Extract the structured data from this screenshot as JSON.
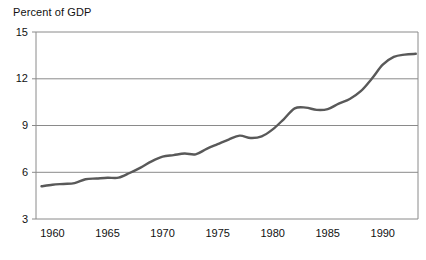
{
  "chart_data": {
    "type": "line",
    "title": "Percent of GDP",
    "xlabel": "",
    "ylabel": "Percent of GDP",
    "xlim": [
      1958.5,
      1993.2
    ],
    "ylim": [
      3,
      15
    ],
    "grid": true,
    "grid_axis": "y",
    "legend": "none",
    "line_color": "#595959",
    "axis_color": "#8a8a8a",
    "ytick_labels": [
      "3",
      "6",
      "9",
      "12",
      "15"
    ],
    "yticks": [
      3,
      6,
      9,
      12,
      15
    ],
    "xtick_labels": [
      "1960",
      "1965",
      "1970",
      "1975",
      "1980",
      "1985",
      "1990"
    ],
    "xticks": [
      1960,
      1965,
      1970,
      1975,
      1980,
      1985,
      1990
    ],
    "x": [
      1959,
      1960,
      1961,
      1962,
      1963,
      1964,
      1965,
      1966,
      1967,
      1968,
      1969,
      1970,
      1971,
      1972,
      1973,
      1974,
      1975,
      1976,
      1977,
      1978,
      1979,
      1980,
      1981,
      1982,
      1983,
      1984,
      1985,
      1986,
      1987,
      1988,
      1989,
      1990,
      1991,
      1992,
      1993
    ],
    "values": [
      5.1,
      5.2,
      5.25,
      5.3,
      5.55,
      5.6,
      5.65,
      5.65,
      5.95,
      6.3,
      6.7,
      7.0,
      7.1,
      7.2,
      7.15,
      7.5,
      7.8,
      8.1,
      8.35,
      8.2,
      8.3,
      8.75,
      9.4,
      10.1,
      10.15,
      10.0,
      10.05,
      10.4,
      10.7,
      11.2,
      12.0,
      12.9,
      13.4,
      13.55,
      13.6
    ],
    "series": [
      {
        "name": "Percent of GDP",
        "values": [
          5.1,
          5.2,
          5.25,
          5.3,
          5.55,
          5.6,
          5.65,
          5.65,
          5.95,
          6.3,
          6.7,
          7.0,
          7.1,
          7.2,
          7.15,
          7.5,
          7.8,
          8.1,
          8.35,
          8.2,
          8.3,
          8.75,
          9.4,
          10.1,
          10.15,
          10.0,
          10.05,
          10.4,
          10.7,
          11.2,
          12.0,
          12.9,
          13.4,
          13.55,
          13.6
        ]
      }
    ]
  }
}
